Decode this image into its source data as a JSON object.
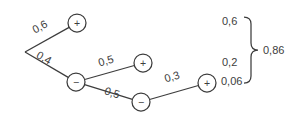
{
  "diagram": {
    "kind": "probability-tree",
    "nodes": [
      {
        "id": "plus-1",
        "sign": "+"
      },
      {
        "id": "minus-1",
        "sign": "−"
      },
      {
        "id": "plus-2",
        "sign": "+"
      },
      {
        "id": "minus-2",
        "sign": "−"
      },
      {
        "id": "plus-3",
        "sign": "+"
      }
    ],
    "edges": [
      {
        "from": "root",
        "to": "plus-1",
        "label": "0,6"
      },
      {
        "from": "root",
        "to": "minus-1",
        "label": "0,4"
      },
      {
        "from": "minus-1",
        "to": "plus-2",
        "label": "0,5"
      },
      {
        "from": "minus-1",
        "to": "minus-2",
        "label": "0,5"
      },
      {
        "from": "minus-2",
        "to": "plus-3",
        "label": "0,3"
      }
    ],
    "results": [
      {
        "label": "0,6"
      },
      {
        "label": "0,2"
      },
      {
        "label": "0,06"
      }
    ],
    "total": "0,86",
    "colors": {
      "stroke": "#3d3d3d",
      "background": "#ffffff"
    }
  }
}
